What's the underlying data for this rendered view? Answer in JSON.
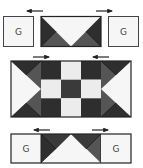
{
  "diagram": {
    "type": "quilt-block-assembly",
    "colors": {
      "background": "#ffffff",
      "outline": "#222222",
      "dark": "#2e2e2e",
      "medium": "#555555",
      "light": "#ececec",
      "white": "#f6f6f6",
      "label": "#444444"
    },
    "rows": [
      {
        "name": "top-row",
        "units": [
          {
            "kind": "square",
            "label": "G"
          },
          {
            "kind": "flying-geese-down"
          },
          {
            "kind": "square",
            "label": "G"
          }
        ],
        "arrows": [
          {
            "direction": "left",
            "position": "above-left"
          },
          {
            "direction": "right",
            "position": "above-right"
          }
        ]
      },
      {
        "name": "middle-row",
        "units": [
          {
            "kind": "flying-geese-right"
          },
          {
            "kind": "nine-patch",
            "pattern": [
              [
                "dark",
                "light",
                "dark"
              ],
              [
                "light",
                "dark",
                "light"
              ],
              [
                "dark",
                "light",
                "dark"
              ]
            ]
          },
          {
            "kind": "flying-geese-left"
          }
        ],
        "arrows": [
          {
            "direction": "right",
            "position": "above-left"
          },
          {
            "direction": "left",
            "position": "above-right"
          }
        ]
      },
      {
        "name": "bottom-row",
        "units": [
          {
            "kind": "square",
            "label": "G"
          },
          {
            "kind": "flying-geese-up"
          },
          {
            "kind": "square",
            "label": "G"
          }
        ],
        "arrows": [
          {
            "direction": "left",
            "position": "above-left"
          },
          {
            "direction": "right",
            "position": "above-right"
          }
        ]
      }
    ],
    "labels": {
      "top_left": "G",
      "top_right": "G",
      "bottom_left": "G",
      "bottom_right": "G"
    }
  }
}
